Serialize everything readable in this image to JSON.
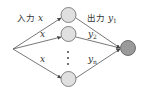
{
  "diagram": {
    "type": "neural-network-ensemble",
    "input_label_prefix": "入力",
    "input_symbol": "x",
    "output_label_prefix": "出力",
    "edge_inputs": [
      {
        "symbol": "x",
        "prefix": "入力"
      },
      {
        "symbol": "x"
      },
      {
        "symbol": "x"
      }
    ],
    "edge_outputs": [
      {
        "symbol": "y",
        "subscript": "1",
        "prefix": "出力"
      },
      {
        "symbol": "y",
        "subscript": "2"
      },
      {
        "symbol": "y",
        "subscript": "n"
      }
    ],
    "ellipsis": "⋮",
    "colors": {
      "hidden_node_fill": "#e0e0e0",
      "output_node_fill": "#9a9a9a",
      "stroke": "#555555"
    }
  }
}
